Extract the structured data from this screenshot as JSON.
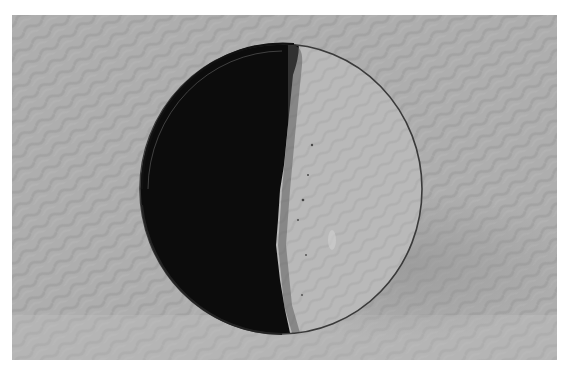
{
  "image": {
    "subject": "ceramic dish with half dark glaze and half pale glaze",
    "background": "grey wavy-textured backdrop",
    "colors": {
      "backdrop": "#aeaeae",
      "backdrop_wave": "#a2a2a2",
      "shadow": "#989898",
      "dark_glaze": "#0c0c0c",
      "pale_glaze": "#b9b9b9",
      "rim": "#3a3a3a"
    }
  }
}
